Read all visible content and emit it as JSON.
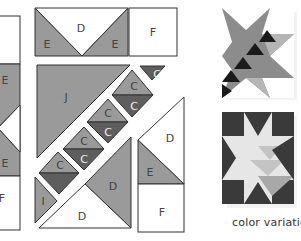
{
  "colors": {
    "stroke": "#333333",
    "medium_gray": "#9a9a9a",
    "dark_gray": "#5e5e5e",
    "white": "#ffffff",
    "label_dark": "#444444",
    "label_light": "#eeeeee",
    "star1_medium": "#8c8c8c",
    "star1_dark": "#1a1a1a",
    "star1_light": "#b5b5b5",
    "star2_dark": "#3a3a3a",
    "star2_light": "#e6e6e6",
    "star2_mid": "#c4c4c4",
    "star2_mid2": "#a8a8a8"
  },
  "pieces": {
    "left_partial": {
      "labels": [
        "E",
        "E",
        "F"
      ]
    },
    "top_strip": {
      "labels": [
        "E",
        "D",
        "E",
        "F"
      ]
    },
    "center_diagonal": {
      "labels": [
        "J",
        "C",
        "C",
        "C",
        "C",
        "C",
        "C",
        "C",
        "C",
        "I",
        "D",
        "D"
      ]
    },
    "right_column": {
      "labels": [
        "D",
        "E",
        "F"
      ]
    }
  },
  "caption": "color variations"
}
